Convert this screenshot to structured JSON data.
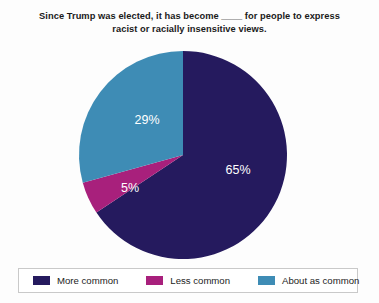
{
  "chart_data": {
    "type": "pie",
    "title": "Since Trump was elected, it has become ____ for people to express racist or racially insensitive views.",
    "title_line1": "Since Trump was elected, it has become ____ for people to express",
    "title_line2": "racist or racially insensitive views.",
    "categories": [
      "More common",
      "Less common",
      "About as common"
    ],
    "values": [
      65,
      5,
      29
    ],
    "value_labels": [
      "65%",
      "5%",
      "29%"
    ],
    "colors": [
      "#251a5e",
      "#a8207c",
      "#3e8cb5"
    ],
    "unit": "%",
    "start_angle_deg": 0,
    "direction": "clockwise",
    "legend_position": "bottom",
    "grid": false,
    "xlabel": "",
    "ylabel": ""
  },
  "legend": {
    "items": [
      {
        "label": "More common",
        "color": "#251a5e",
        "value": "65%"
      },
      {
        "label": "Less common",
        "color": "#a8207c",
        "value": "5%"
      },
      {
        "label": "About as common",
        "color": "#3e8cb5",
        "value": "29%"
      }
    ]
  },
  "pie": {
    "center_x": 183,
    "center_y": 155,
    "radius": 104,
    "slices": [
      {
        "name": "More common",
        "label": "65%",
        "label_x": 238,
        "label_y": 169,
        "color": "#251a5e"
      },
      {
        "name": "About as common",
        "label": "29%",
        "label_x": 147,
        "label_y": 119,
        "color": "#3e8cb5"
      },
      {
        "name": "Less common",
        "label": "5%",
        "label_x": 130,
        "label_y": 188,
        "color": "#a8207c"
      }
    ]
  }
}
